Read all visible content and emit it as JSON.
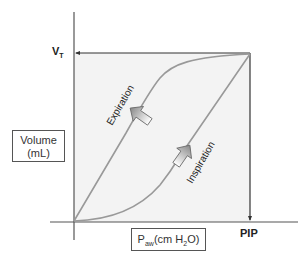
{
  "diagram": {
    "y_axis_label_line1": "Volume",
    "y_axis_label_line2": "(mL)",
    "x_axis_label_main": "P",
    "x_axis_label_sub": "aw",
    "x_axis_label_unit_pre": "(cm H",
    "x_axis_label_unit_sub": "2",
    "x_axis_label_unit_post": "O)",
    "y_marker_main": "V",
    "y_marker_sub": "T",
    "x_marker": "PIP",
    "curve_labels": {
      "expiration": "Expiration",
      "inspiration": "Inspiration"
    },
    "colors": {
      "axis": "#444444",
      "curve": "#999999",
      "fill": "#f3f3f3",
      "arrow_fill": "#aaaaaa"
    }
  }
}
